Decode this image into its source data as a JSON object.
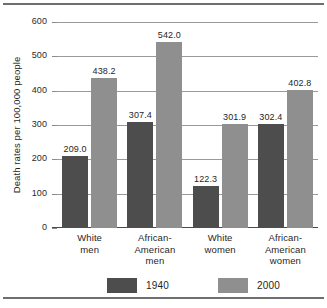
{
  "chart_data": {
    "type": "bar",
    "title": "",
    "subtitle": "",
    "xlabel": "",
    "ylabel": "Death rates per 100,000 people",
    "ylim": [
      0,
      600
    ],
    "yticks": [
      0,
      100,
      200,
      300,
      400,
      500,
      600
    ],
    "ytick_labels": [
      "0",
      "100",
      "200",
      "300",
      "400",
      "500",
      "600"
    ],
    "grid": true,
    "legend_position": "bottom",
    "categories": [
      "White\nmen",
      "African-\nAmerican\nmen",
      "White\nwomen",
      "African-\nAmerican\nwomen"
    ],
    "series": [
      {
        "name": "1940",
        "color": "#4d4d4d",
        "values": [
          209.0,
          307.4,
          122.3,
          302.4
        ],
        "labels": [
          "209.0",
          "307.4",
          "122.3",
          "302.4"
        ]
      },
      {
        "name": "2000",
        "color": "#8f8f8f",
        "values": [
          438.2,
          542.0,
          301.9,
          402.8
        ],
        "labels": [
          "438.2",
          "542.0",
          "301.9",
          "402.8"
        ]
      }
    ],
    "legend": [
      {
        "label": "1940",
        "color": "#4d4d4d"
      },
      {
        "label": "2000",
        "color": "#8f8f8f"
      }
    ]
  },
  "colors": {
    "series_1940": "#4d4d4d",
    "series_2000": "#8f8f8f",
    "gridline": "#9a9a9a",
    "rule": "#6e6e6e",
    "background": "#ffffff"
  }
}
